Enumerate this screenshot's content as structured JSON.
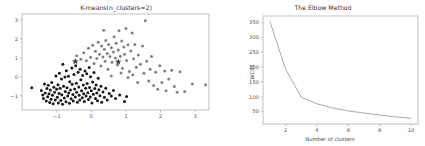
{
  "figure": {
    "width": 425,
    "height": 146,
    "background": "#ffffff"
  },
  "colors": {
    "cluster_a": "#1a1a1a",
    "cluster_b": "#828282",
    "centroid": "#3d3d3d",
    "curve": "#9a9a9a",
    "axis": "#b0b0b0",
    "tick_text": "#555555",
    "title_text": "#333333"
  },
  "chart_data": [
    {
      "type": "scatter",
      "title": "K-means(n_clusters=2)",
      "xlabel": "",
      "ylabel": "",
      "xlim": [
        -2.0,
        3.4
      ],
      "ylim": [
        -1.75,
        3.3
      ],
      "xticks": [
        -1,
        0,
        1,
        2,
        3
      ],
      "yticks": [
        -1,
        0,
        1,
        2,
        3
      ],
      "grid": false,
      "legend": "none",
      "series": [
        {
          "name": "cluster 0",
          "marker": "circle",
          "color": "#1a1a1a",
          "points": [
            [
              -1.72,
              -0.58
            ],
            [
              -1.44,
              -0.72
            ],
            [
              -1.4,
              -0.96
            ],
            [
              -1.38,
              -1.15
            ],
            [
              -1.35,
              -0.38
            ],
            [
              -1.33,
              -0.85
            ],
            [
              -1.3,
              -1.28
            ],
            [
              -1.28,
              -0.62
            ],
            [
              -1.26,
              -1.05
            ],
            [
              -1.24,
              -0.45
            ],
            [
              -1.22,
              -0.9
            ],
            [
              -1.2,
              -1.35
            ],
            [
              -1.18,
              -0.7
            ],
            [
              -1.16,
              -1.18
            ],
            [
              -1.14,
              -0.3
            ],
            [
              -1.12,
              -0.98
            ],
            [
              -1.1,
              -1.42
            ],
            [
              -1.08,
              -0.55
            ],
            [
              -1.06,
              -0.82
            ],
            [
              -1.04,
              -1.22
            ],
            [
              -1.02,
              0.04
            ],
            [
              -1.0,
              -0.66
            ],
            [
              -0.98,
              -1.08
            ],
            [
              -0.96,
              -0.42
            ],
            [
              -0.95,
              -1.38
            ],
            [
              -0.93,
              -0.88
            ],
            [
              -0.92,
              0.18
            ],
            [
              -0.9,
              -0.6
            ],
            [
              -0.88,
              -1.25
            ],
            [
              -0.86,
              -0.12
            ],
            [
              -0.85,
              -0.95
            ],
            [
              -0.83,
              -1.45
            ],
            [
              -0.82,
              0.66
            ],
            [
              -0.8,
              -0.5
            ],
            [
              -0.78,
              -1.12
            ],
            [
              -0.76,
              -0.02
            ],
            [
              -0.75,
              -0.78
            ],
            [
              -0.73,
              -1.32
            ],
            [
              -0.72,
              0.32
            ],
            [
              -0.7,
              -0.58
            ],
            [
              -0.68,
              -1.02
            ],
            [
              -0.66,
              0.02
            ],
            [
              -0.65,
              -0.86
            ],
            [
              -0.63,
              -1.4
            ],
            [
              -0.62,
              -0.26
            ],
            [
              -0.6,
              -0.7
            ],
            [
              -0.58,
              -1.16
            ],
            [
              -0.56,
              0.46
            ],
            [
              -0.55,
              -0.4
            ],
            [
              -0.53,
              -0.94
            ],
            [
              -0.52,
              -1.28
            ],
            [
              -0.5,
              0.12
            ],
            [
              -0.48,
              -0.64
            ],
            [
              -0.46,
              -1.06
            ],
            [
              -0.45,
              0.58
            ],
            [
              -0.43,
              -0.34
            ],
            [
              -0.42,
              -0.82
            ],
            [
              -0.4,
              -1.34
            ],
            [
              -0.38,
              0.24
            ],
            [
              -0.36,
              -0.54
            ],
            [
              -0.35,
              -0.98
            ],
            [
              -0.33,
              -1.22
            ],
            [
              -0.32,
              0.4
            ],
            [
              -0.3,
              -0.16
            ],
            [
              -0.28,
              -0.74
            ],
            [
              -0.26,
              -1.1
            ],
            [
              -0.25,
              0.06
            ],
            [
              -0.23,
              -0.44
            ],
            [
              -0.22,
              -0.9
            ],
            [
              -0.2,
              -1.3
            ],
            [
              -0.18,
              0.3
            ],
            [
              -0.16,
              -0.6
            ],
            [
              -0.15,
              -1.02
            ],
            [
              -0.13,
              0.16
            ],
            [
              -0.12,
              -0.36
            ],
            [
              -0.1,
              -0.84
            ],
            [
              -0.08,
              -1.2
            ],
            [
              -0.06,
              0.48
            ],
            [
              -0.05,
              -0.56
            ],
            [
              -0.03,
              -1.06
            ],
            [
              -0.02,
              0.0
            ],
            [
              0.0,
              -0.74
            ],
            [
              0.02,
              -1.38
            ],
            [
              0.04,
              -0.28
            ],
            [
              0.06,
              -0.92
            ],
            [
              0.08,
              0.22
            ],
            [
              0.1,
              -0.62
            ],
            [
              0.12,
              -1.14
            ],
            [
              0.14,
              -0.44
            ],
            [
              0.16,
              -0.86
            ],
            [
              0.18,
              -1.26
            ],
            [
              0.2,
              -0.08
            ],
            [
              0.22,
              -0.68
            ],
            [
              0.25,
              -1.0
            ],
            [
              0.28,
              -0.5
            ],
            [
              0.3,
              -1.34
            ],
            [
              0.34,
              -0.8
            ],
            [
              0.38,
              -1.08
            ],
            [
              0.42,
              -0.6
            ],
            [
              0.46,
              -1.22
            ],
            [
              0.52,
              -0.88
            ],
            [
              0.58,
              -1.02
            ],
            [
              0.64,
              -0.72
            ],
            [
              0.7,
              -1.14
            ],
            [
              0.82,
              -0.96
            ],
            [
              0.96,
              -1.3
            ],
            [
              1.02,
              -1.04
            ]
          ]
        },
        {
          "name": "cluster 1",
          "marker": "circle",
          "color": "#828282",
          "points": [
            [
              -0.42,
              1.1
            ],
            [
              -0.3,
              0.92
            ],
            [
              -0.22,
              1.26
            ],
            [
              -0.14,
              0.84
            ],
            [
              -0.08,
              1.5
            ],
            [
              -0.02,
              1.02
            ],
            [
              0.04,
              1.66
            ],
            [
              0.08,
              0.7
            ],
            [
              0.12,
              1.34
            ],
            [
              0.16,
              0.96
            ],
            [
              0.2,
              1.82
            ],
            [
              0.24,
              1.18
            ],
            [
              0.28,
              0.56
            ],
            [
              0.3,
              1.62
            ],
            [
              0.34,
              1.04
            ],
            [
              0.36,
              2.44
            ],
            [
              0.38,
              1.44
            ],
            [
              0.4,
              0.82
            ],
            [
              0.42,
              1.9
            ],
            [
              0.46,
              1.22
            ],
            [
              0.48,
              0.4
            ],
            [
              0.5,
              1.7
            ],
            [
              0.54,
              1.06
            ],
            [
              0.58,
              1.52
            ],
            [
              0.6,
              0.76
            ],
            [
              0.64,
              1.3
            ],
            [
              0.66,
              2.1
            ],
            [
              0.7,
              0.98
            ],
            [
              0.72,
              1.76
            ],
            [
              0.76,
              0.62
            ],
            [
              0.78,
              1.4
            ],
            [
              0.8,
              2.42
            ],
            [
              0.84,
              1.08
            ],
            [
              0.88,
              1.88
            ],
            [
              0.9,
              0.44
            ],
            [
              0.94,
              1.56
            ],
            [
              0.96,
              1.18
            ],
            [
              1.0,
              2.54
            ],
            [
              1.02,
              0.86
            ],
            [
              1.06,
              1.68
            ],
            [
              1.1,
              0.28
            ],
            [
              1.14,
              1.36
            ],
            [
              1.18,
              2.3
            ],
            [
              1.22,
              0.94
            ],
            [
              1.26,
              1.7
            ],
            [
              1.3,
              0.5
            ],
            [
              1.36,
              1.14
            ],
            [
              1.42,
              0.66
            ],
            [
              1.48,
              1.62
            ],
            [
              1.52,
              0.18
            ],
            [
              1.56,
              2.94
            ],
            [
              1.6,
              0.82
            ],
            [
              1.66,
              -0.22
            ],
            [
              1.7,
              0.4
            ],
            [
              1.74,
              1.06
            ],
            [
              1.8,
              -0.46
            ],
            [
              1.86,
              0.24
            ],
            [
              1.92,
              -0.66
            ],
            [
              1.98,
              0.58
            ],
            [
              2.04,
              -0.3
            ],
            [
              2.12,
              0.3
            ],
            [
              2.16,
              -0.74
            ],
            [
              2.24,
              -0.12
            ],
            [
              2.32,
              0.34
            ],
            [
              2.4,
              -0.52
            ],
            [
              2.48,
              -0.82
            ],
            [
              2.56,
              0.26
            ],
            [
              2.7,
              -0.78
            ],
            [
              2.92,
              -0.38
            ],
            [
              3.3,
              -0.42
            ],
            [
              0.58,
              0.04
            ],
            [
              0.86,
              0.2
            ],
            [
              1.06,
              -0.04
            ],
            [
              1.2,
              0.1
            ],
            [
              1.34,
              -0.3
            ]
          ]
        }
      ],
      "centroids": [
        {
          "name": "centroid-0",
          "x": -0.46,
          "y": 0.8,
          "marker": "star"
        },
        {
          "name": "centroid-1",
          "x": 0.78,
          "y": 0.78,
          "marker": "star"
        }
      ]
    },
    {
      "type": "line",
      "title": "The Elbow Method",
      "xlabel": "Number of clusters",
      "ylabel": "WCSS",
      "xlim": [
        0.55,
        10.45
      ],
      "ylim": [
        8,
        372
      ],
      "xticks": [
        2,
        4,
        6,
        8,
        10
      ],
      "yticks": [
        50,
        100,
        150,
        200,
        250,
        300,
        350
      ],
      "grid": false,
      "legend": "none",
      "x": [
        1,
        2,
        3,
        4,
        5,
        6,
        7,
        8,
        9,
        10
      ],
      "values": [
        352,
        192,
        98,
        76,
        62,
        52,
        45,
        38,
        32,
        27
      ]
    }
  ]
}
